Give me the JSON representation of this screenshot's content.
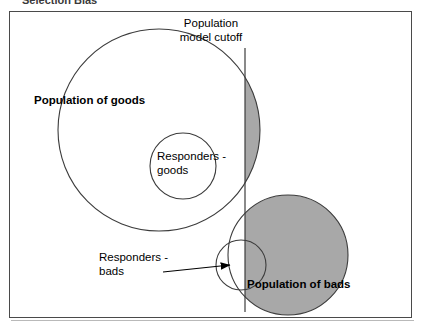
{
  "caption": {
    "text": "Selection Bias"
  },
  "figure": {
    "labels": {
      "cutoff_line_1": "Population",
      "cutoff_line_2": "model cutoff",
      "population_of_goods": "Population of goods",
      "responders_goods_line_1": "Responders -",
      "responders_goods_line_2": "goods",
      "responders_bads_line_1": "Responders -",
      "responders_bads_line_2": "bads",
      "population_of_bads": "Population of bads"
    },
    "colors": {
      "shaded_region": "#a8a8a8",
      "outline": "#3c3c3c",
      "frame": "#4a4a4a",
      "background": "#ffffff",
      "text": "#000000"
    },
    "geometry": {
      "cutoff_x": 245,
      "cutoff_y_top": 48,
      "cutoff_y_bottom": 312,
      "goods_circle": {
        "cx": 159,
        "cy": 130,
        "r": 101
      },
      "responders_goods_circle": {
        "cx": 183,
        "cy": 166,
        "r": 33
      },
      "bads_circle": {
        "cx": 288,
        "cy": 255,
        "r": 60
      },
      "responders_bads_circle": {
        "cx": 241,
        "cy": 265,
        "r": 25
      }
    }
  }
}
